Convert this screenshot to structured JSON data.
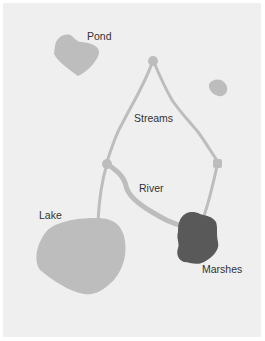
{
  "diagram": {
    "labels": {
      "pond": "Pond",
      "streams": "Streams",
      "river": "River",
      "lake": "Lake",
      "marshes": "Marshes"
    },
    "colors": {
      "background": "#efefef",
      "water": "#bdbdbd",
      "marsh": "#595959",
      "text": "#333333"
    }
  }
}
